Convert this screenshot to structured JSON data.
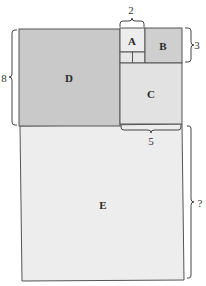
{
  "diagram": {
    "squares": [
      {
        "id": "A",
        "label": "A",
        "fill": "#ededed"
      },
      {
        "id": "B",
        "label": "B",
        "fill": "#cfcfcf"
      },
      {
        "id": "C",
        "label": "C",
        "fill": "#e2e2e2"
      },
      {
        "id": "D",
        "label": "D",
        "fill": "#c9c9c9"
      },
      {
        "id": "E",
        "label": "E",
        "fill": "#ededed"
      }
    ],
    "small_squares_fill": "#e6e6e6",
    "dimensions": {
      "a_width": "2",
      "b_height": "3",
      "d_height": "8",
      "c_width": "5",
      "e_height": "?"
    }
  }
}
